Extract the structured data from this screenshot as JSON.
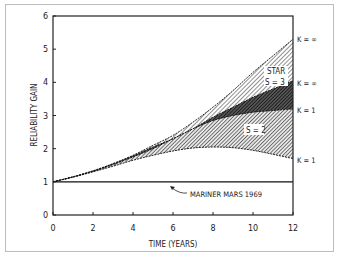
{
  "chart_data": {
    "type": "area",
    "title": "",
    "xlabel": "TIME (YEARS)",
    "ylabel": "RELIABILITY GAIN",
    "xlim": [
      0,
      12
    ],
    "ylim": [
      0,
      6
    ],
    "x_ticks": [
      0,
      2,
      4,
      6,
      8,
      10,
      12
    ],
    "y_ticks": [
      0,
      1,
      2,
      3,
      4,
      5,
      6
    ],
    "grid": false,
    "x": [
      0,
      1,
      2,
      3,
      4,
      5,
      6,
      7,
      8,
      9,
      10,
      11,
      12
    ],
    "series": [
      {
        "name": "STAR S = 3, K = ∞",
        "values": [
          1.0,
          1.15,
          1.33,
          1.55,
          1.8,
          2.1,
          2.4,
          2.8,
          3.25,
          3.75,
          4.3,
          4.8,
          5.3
        ]
      },
      {
        "name": "S = 2, K = ∞",
        "values": [
          1.0,
          1.15,
          1.33,
          1.54,
          1.78,
          2.05,
          2.3,
          2.6,
          2.95,
          3.25,
          3.55,
          3.8,
          4.05
        ]
      },
      {
        "name": "STAR S = 3, K = 1",
        "values": [
          1.0,
          1.15,
          1.32,
          1.52,
          1.75,
          2.0,
          2.3,
          2.6,
          2.85,
          3.0,
          3.1,
          3.15,
          3.2
        ]
      },
      {
        "name": "S = 2, K = 1",
        "values": [
          1.0,
          1.14,
          1.3,
          1.47,
          1.65,
          1.8,
          1.93,
          2.02,
          2.05,
          2.03,
          1.95,
          1.83,
          1.7
        ]
      },
      {
        "name": "MARINER MARS 1969",
        "values": [
          1,
          1,
          1,
          1,
          1,
          1,
          1,
          1,
          1,
          1,
          1,
          1,
          1
        ]
      }
    ],
    "annotations": [
      {
        "text": "STAR",
        "x": 10.9,
        "y": 4.3
      },
      {
        "text": "S = 3",
        "x": 10.9,
        "y": 4.0
      },
      {
        "text": "S = 2",
        "x": 9.9,
        "y": 2.5
      },
      {
        "text": "MARINER MARS 1969",
        "x": 7.0,
        "y": 0.6
      },
      {
        "text": "K = ∞",
        "x": 12,
        "y": 5.3
      },
      {
        "text": "K = ∞",
        "x": 12,
        "y": 4.0
      },
      {
        "text": "K = 1",
        "x": 12,
        "y": 3.2
      },
      {
        "text": "K = 1",
        "x": 12,
        "y": 1.7
      }
    ],
    "legend": null
  },
  "labels": {
    "xlabel": "TIME (YEARS)",
    "ylabel": "RELIABILITY GAIN",
    "star": "STAR",
    "s3": "S = 3",
    "s2": "S = 2",
    "mariner": "MARINER MARS 1969",
    "k_inf": "K = ∞",
    "k_one": "K = 1"
  }
}
